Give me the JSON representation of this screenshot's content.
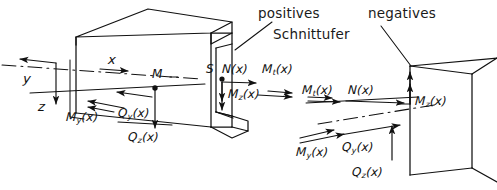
{
  "figure": {
    "type": "engineering-diagram",
    "language": "de",
    "background_color": "#ffffff",
    "ink_color": "#111111",
    "width": 497,
    "height": 190
  },
  "annotations": {
    "positive_face_word": "positives",
    "positive_face_word2": "Schnittufer",
    "negative_face_word": "negatives"
  },
  "axes": {
    "x": "x",
    "y": "y",
    "z": "z"
  },
  "points": {
    "centroid_left": "M",
    "shear_center_left": "S"
  },
  "left_face": {
    "caption": "positives Schnittufer",
    "loads": [
      {
        "symbol": "N",
        "sub": "",
        "arg": "(x)",
        "kind": "force",
        "dir": "right"
      },
      {
        "symbol": "M",
        "sub": "t",
        "arg": "(x)",
        "kind": "moment",
        "dir": "right"
      },
      {
        "symbol": "M",
        "sub": "z",
        "arg": "(x)",
        "kind": "moment",
        "dir": "down"
      },
      {
        "symbol": "M",
        "sub": "y",
        "arg": "(x)",
        "kind": "moment",
        "dir": "left"
      },
      {
        "symbol": "Q",
        "sub": "y",
        "arg": "(x)",
        "kind": "force",
        "dir": "left"
      },
      {
        "symbol": "Q",
        "sub": "z",
        "arg": "(x)",
        "kind": "force",
        "dir": "down"
      }
    ]
  },
  "right_face": {
    "caption": "negatives Schnittufer",
    "loads": [
      {
        "symbol": "M",
        "sub": "t",
        "arg": "(x)",
        "kind": "moment",
        "dir": "right"
      },
      {
        "symbol": "N",
        "sub": "",
        "arg": "(x)",
        "kind": "force",
        "dir": "right"
      },
      {
        "symbol": "M",
        "sub": "z",
        "arg": "(x)",
        "kind": "moment",
        "dir": "up"
      },
      {
        "symbol": "M",
        "sub": "y",
        "arg": "(x)",
        "kind": "moment",
        "dir": "right"
      },
      {
        "symbol": "Q",
        "sub": "y",
        "arg": "(x)",
        "kind": "force",
        "dir": "right"
      },
      {
        "symbol": "Q",
        "sub": "z",
        "arg": "(x)",
        "kind": "force",
        "dir": "up"
      }
    ]
  },
  "labels": {
    "N": "N",
    "M": "M",
    "Q": "Q",
    "S": "S",
    "arg": "(x)",
    "sub_t": "t",
    "sub_y": "y",
    "sub_z": "z"
  }
}
